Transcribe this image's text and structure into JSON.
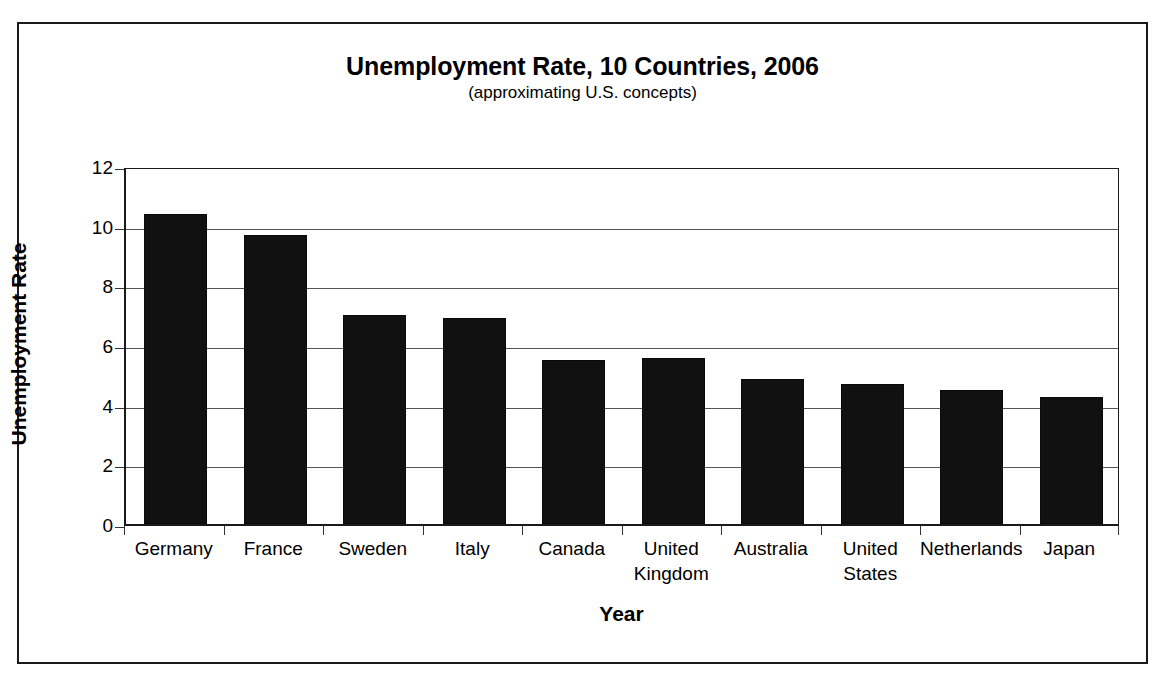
{
  "chart_data": {
    "type": "bar",
    "title": "Unemployment Rate, 10 Countries, 2006",
    "subtitle": "(approximating U.S. concepts)",
    "xlabel": "Year",
    "ylabel": "Unemployment Rate",
    "categories": [
      "Germany",
      "France",
      "Sweden",
      "Italy",
      "Canada",
      "United Kingdom",
      "Australia",
      "United States",
      "Netherlands",
      "Japan"
    ],
    "values": [
      10.4,
      9.7,
      7.0,
      6.9,
      5.5,
      5.55,
      4.85,
      4.7,
      4.5,
      4.25
    ],
    "ylim": [
      0,
      12
    ],
    "yticks": [
      0,
      2,
      4,
      6,
      8,
      10,
      12
    ],
    "ytick_labels": [
      "0",
      "2",
      "4",
      "6",
      "8",
      "10",
      "12"
    ],
    "grid": true,
    "legend": false,
    "bar_color": "#111111",
    "gridline_color": "#555555",
    "frame_color": "#1a1a1a"
  }
}
